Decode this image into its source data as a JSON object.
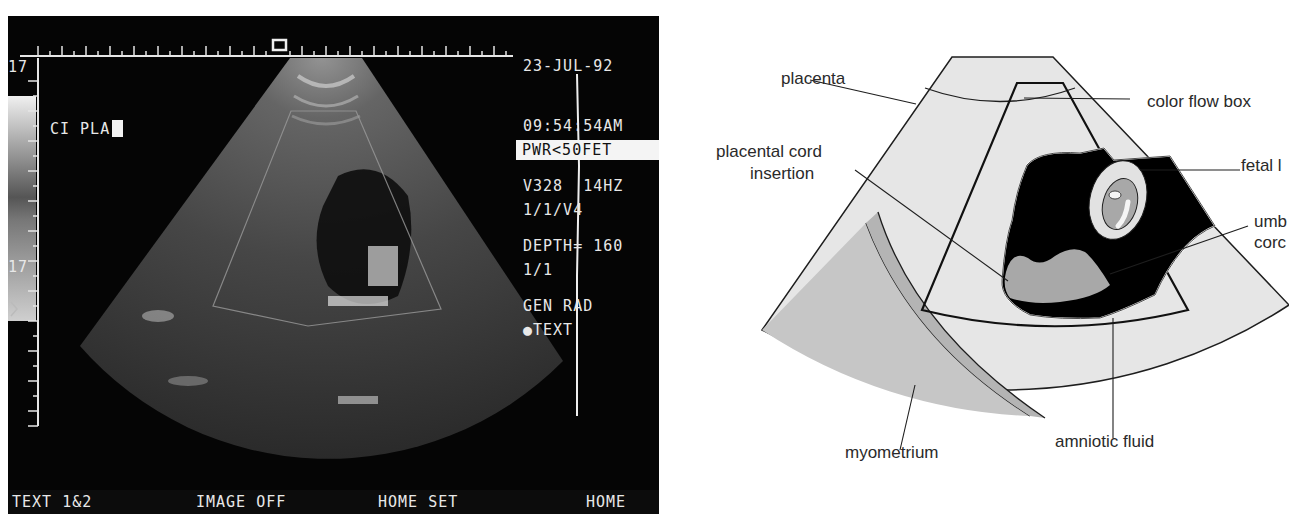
{
  "ultrasound": {
    "info": {
      "date": "23-JUL-92",
      "time": "09:54:54AM",
      "probe_rate": "V328  14HZ",
      "depth": "DEPTH= 160",
      "mode": "GEN RAD"
    },
    "power": "PWR<50FET",
    "settings": {
      "line1": "1/1/V4",
      "line2": "1/1",
      "text_marker": "●TEXT"
    },
    "annotation": "CI PLA",
    "depth_scale": {
      "top": "17",
      "middle": "17"
    },
    "softkeys": [
      {
        "label": "TEXT 1&2"
      },
      {
        "label": "IMAGE OFF"
      },
      {
        "label": "HOME SET"
      },
      {
        "label": "HOME"
      }
    ]
  },
  "diagram": {
    "labels": {
      "placenta": "placenta",
      "placental_cord_insertion_1": "placental cord",
      "placental_cord_insertion_2": "insertion",
      "color_flow_box": "color flow box",
      "fetal_limb": "fetal l",
      "umbilical_cord_1": "umb",
      "umbilical_cord_2": "corc",
      "myometrium": "myometrium",
      "amniotic_fluid": "amniotic fluid"
    },
    "colors": {
      "light_tissue": "#e4e4e4",
      "myometrium": "#b8b8b8",
      "outer_tissue": "#c9c9c9",
      "fluid": "#000000",
      "cord": "#a9a9a9",
      "outline": "#1e1e1e"
    }
  }
}
